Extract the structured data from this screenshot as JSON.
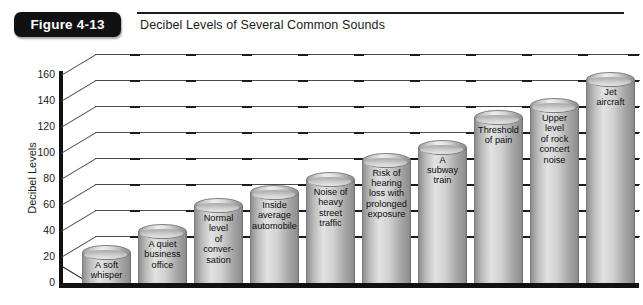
{
  "header": {
    "figure_badge": "Figure 4-13",
    "title": "Decibel Levels of Several Common Sounds"
  },
  "chart_data": {
    "type": "bar",
    "title": "Decibel Levels of Several Common Sounds",
    "xlabel": "",
    "ylabel": "Decibel Levels",
    "ylim": [
      0,
      160
    ],
    "ytick_step": 20,
    "yticks": [
      0,
      20,
      40,
      60,
      80,
      100,
      120,
      140,
      160
    ],
    "ytick_labels": [
      "0",
      "20",
      "40",
      "60",
      "80",
      "100",
      "120",
      "140",
      "160"
    ],
    "grid": true,
    "legend": "none",
    "style": "3d-cylinder",
    "bar_fill": "#cfcfcf",
    "categories": [
      "A soft whisper",
      "A quiet business office",
      "Normal level of conversation",
      "Inside average automobile",
      "Noise of heavy street traffic",
      "Risk of hearing loss with prolonged exposure",
      "A subway train",
      "Threshold of pain",
      "Upper level of rock concert noise",
      "Jet aircraft"
    ],
    "values": [
      24,
      40,
      60,
      70,
      80,
      95,
      105,
      128,
      137,
      157
    ],
    "bar_labels": [
      "A soft\nwhisper",
      "A quiet\nbusiness\noffice",
      "Normal\nlevel\nof\nconver-\nsation",
      "Inside\naverage\nautomobile",
      "Noise of\nheavy\nstreet\ntraffic",
      "Risk of\nhearing\nloss with\nprolonged\nexposure",
      "A\nsubway\ntrain",
      "Threshold\nof pain",
      "Upper\nlevel\nof rock\nconcert\nnoise",
      "Jet\naircraft"
    ]
  },
  "colors": {
    "badge_bg": "#111113",
    "badge_text": "#ffffff",
    "axis": "#111113",
    "grid": "#4a4a4a",
    "text": "#1b1b1b"
  }
}
